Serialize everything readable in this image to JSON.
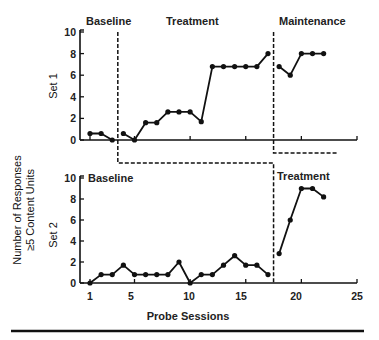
{
  "chart_data": {
    "type": "line",
    "title": "",
    "xlabel": "Probe Sessions",
    "ylabel": "Number of Responses ≥5 Content Units",
    "ylabel_lines": [
      "Number of Responses",
      "≥5 Content Units"
    ],
    "x_ticks": [
      1,
      5,
      10,
      15,
      20,
      25
    ],
    "xlim": [
      0,
      25
    ],
    "y_ticks": [
      0,
      2,
      4,
      6,
      8,
      10
    ],
    "ylim": [
      0,
      10
    ],
    "grid": false,
    "panels": [
      {
        "name": "Set 1",
        "phases": [
          {
            "label": "Baseline",
            "sessions": [
              1,
              2,
              3
            ],
            "values": [
              0.6,
              0.6,
              0
            ]
          },
          {
            "label": "Treatment",
            "sessions": [
              4,
              5,
              6,
              7,
              8,
              9,
              10,
              11,
              12,
              13,
              14,
              15,
              16,
              17
            ],
            "values": [
              0.6,
              0,
              1.6,
              1.6,
              2.6,
              2.6,
              2.6,
              1.7,
              6.8,
              6.8,
              6.8,
              6.8,
              6.8,
              8
            ]
          },
          {
            "label": "Maintenance",
            "sessions": [
              18,
              19,
              20,
              21,
              22
            ],
            "values": [
              6.8,
              6,
              8,
              8,
              8
            ]
          }
        ],
        "phase_changes": [
          3.5,
          17.5
        ]
      },
      {
        "name": "Set 2",
        "phases": [
          {
            "label": "Baseline",
            "sessions": [
              1,
              2,
              3,
              4,
              5,
              6,
              7,
              8,
              9,
              10,
              11,
              12,
              13,
              14,
              15,
              16,
              17
            ],
            "values": [
              0,
              0.8,
              0.8,
              1.7,
              0.8,
              0.8,
              0.8,
              0.8,
              2,
              0,
              0.8,
              0.8,
              1.7,
              2.6,
              1.7,
              1.7,
              0.8
            ]
          },
          {
            "label": "Treatment",
            "sessions": [
              18,
              19,
              20,
              21,
              22
            ],
            "values": [
              2.8,
              6,
              9,
              9,
              8.2
            ]
          }
        ],
        "phase_changes": [
          17.5
        ]
      }
    ]
  },
  "labels": {
    "set1": "Set 1",
    "set2": "Set 2",
    "top_baseline": "Baseline",
    "top_treatment": "Treatment",
    "top_maintenance": "Maintenance",
    "bottom_baseline": "Baseline",
    "bottom_treatment": "Treatment",
    "xlabel": "Probe Sessions",
    "ylabel_line1": "Number of Responses",
    "ylabel_line2": "≥5 Content Units",
    "x_tick_1": "1",
    "x_tick_5": "5",
    "x_tick_10": "10",
    "x_tick_15": "15",
    "x_tick_20": "20",
    "x_tick_25": "25",
    "y_tick_0": "0",
    "y_tick_2": "2",
    "y_tick_4": "4",
    "y_tick_6": "6",
    "y_tick_8": "8",
    "y_tick_10": "10"
  }
}
